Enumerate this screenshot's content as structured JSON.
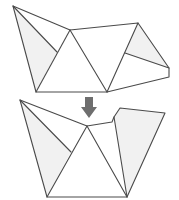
{
  "diagram": {
    "title": "",
    "type": "origami-folding-step",
    "steps": [
      {
        "id": "before",
        "label": "",
        "outline": [
          [
            13,
            6
          ],
          [
            70,
            30
          ],
          [
            138,
            23
          ],
          [
            169,
            68
          ],
          [
            169,
            77
          ],
          [
            107,
            92
          ],
          [
            36,
            92
          ]
        ],
        "creases": [
          [
            [
              13,
              6
            ],
            [
              57,
              52
            ]
          ],
          [
            [
              70,
              30
            ],
            [
              36,
              92
            ]
          ],
          [
            [
              70,
              30
            ],
            [
              107,
              92
            ]
          ],
          [
            [
              138,
              23
            ],
            [
              107,
              92
            ]
          ],
          [
            [
              125,
              53
            ],
            [
              169,
              68
            ]
          ]
        ],
        "shaded": [
          [
            [
              13,
              6
            ],
            [
              57,
              52
            ],
            [
              36,
              92
            ]
          ],
          [
            [
              138,
              23
            ],
            [
              169,
              68
            ],
            [
              125,
              53
            ]
          ]
        ]
      },
      {
        "id": "after",
        "label": "",
        "outline": [
          [
            20,
            100
          ],
          [
            87,
            126
          ],
          [
            112,
            122
          ],
          [
            114,
            117
          ],
          [
            120,
            108
          ],
          [
            165,
            113
          ],
          [
            127,
            197
          ],
          [
            47,
            197
          ]
        ],
        "creases": [
          [
            [
              20,
              100
            ],
            [
              71,
              152
            ]
          ],
          [
            [
              87,
              126
            ],
            [
              47,
              197
            ]
          ],
          [
            [
              87,
              126
            ],
            [
              127,
              197
            ]
          ],
          [
            [
              114,
              117
            ],
            [
              127,
              197
            ]
          ]
        ],
        "shaded": [
          [
            [
              20,
              100
            ],
            [
              71,
              152
            ],
            [
              47,
              197
            ]
          ],
          [
            [
              114,
              117
            ],
            [
              120,
              108
            ],
            [
              165,
              113
            ],
            [
              127,
              197
            ]
          ]
        ]
      }
    ],
    "arrow": {
      "direction": "down",
      "color": "#6e6e6e",
      "meaning": "next-step"
    },
    "colors": {
      "line": "#4a4a4a",
      "shade": "#f1f1f1",
      "background": "#ffffff"
    }
  }
}
